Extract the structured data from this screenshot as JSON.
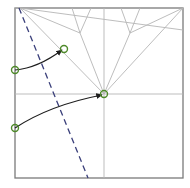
{
  "diagram": {
    "type": "origami-crease-pattern-step",
    "paper": {
      "x": 15,
      "y": 8,
      "width": 168,
      "height": 170,
      "border_color": "#7a7a7a"
    },
    "colors": {
      "crease": "#b5b5b5",
      "valley_fold": "#3a3f7a",
      "arrow": "#1e1e1e",
      "point_marker": "#4f8a2a"
    },
    "crease_lines": [
      {
        "x1": 15,
        "y1": 94,
        "x2": 183,
        "y2": 94
      },
      {
        "x1": 104,
        "y1": 8,
        "x2": 104,
        "y2": 178
      },
      {
        "x1": 20,
        "y1": 8,
        "x2": 104,
        "y2": 94
      },
      {
        "x1": 20,
        "y1": 8,
        "x2": 183,
        "y2": 30
      },
      {
        "x1": 183,
        "y1": 8,
        "x2": 104,
        "y2": 94
      },
      {
        "x1": 183,
        "y1": 8,
        "x2": 130,
        "y2": 33
      },
      {
        "x1": 20,
        "y1": 8,
        "x2": 80,
        "y2": 33
      },
      {
        "x1": 80,
        "y1": 33,
        "x2": 104,
        "y2": 94
      },
      {
        "x1": 130,
        "y1": 33,
        "x2": 104,
        "y2": 94
      },
      {
        "x1": 80,
        "y1": 33,
        "x2": 72,
        "y2": 8
      },
      {
        "x1": 80,
        "y1": 33,
        "x2": 91,
        "y2": 8
      },
      {
        "x1": 130,
        "y1": 33,
        "x2": 121,
        "y2": 8
      },
      {
        "x1": 130,
        "y1": 33,
        "x2": 140,
        "y2": 8
      },
      {
        "x1": 20,
        "y1": 8,
        "x2": 15,
        "y2": 8
      }
    ],
    "valley_fold_line": {
      "x1": 19,
      "y1": 8,
      "x2": 88,
      "y2": 178
    },
    "arrows": [
      {
        "from": [
          15,
          70
        ],
        "ctrl": [
          38,
          68
        ],
        "to": [
          62,
          50
        ]
      },
      {
        "from": [
          15,
          128
        ],
        "ctrl": [
          50,
          105
        ],
        "to": [
          102,
          95
        ]
      }
    ],
    "points": [
      {
        "cx": 64,
        "cy": 49,
        "r": 3.5
      },
      {
        "cx": 15,
        "cy": 70,
        "r": 3.5
      },
      {
        "cx": 104,
        "cy": 94,
        "r": 3.5
      },
      {
        "cx": 15,
        "cy": 128,
        "r": 3.5
      }
    ]
  }
}
